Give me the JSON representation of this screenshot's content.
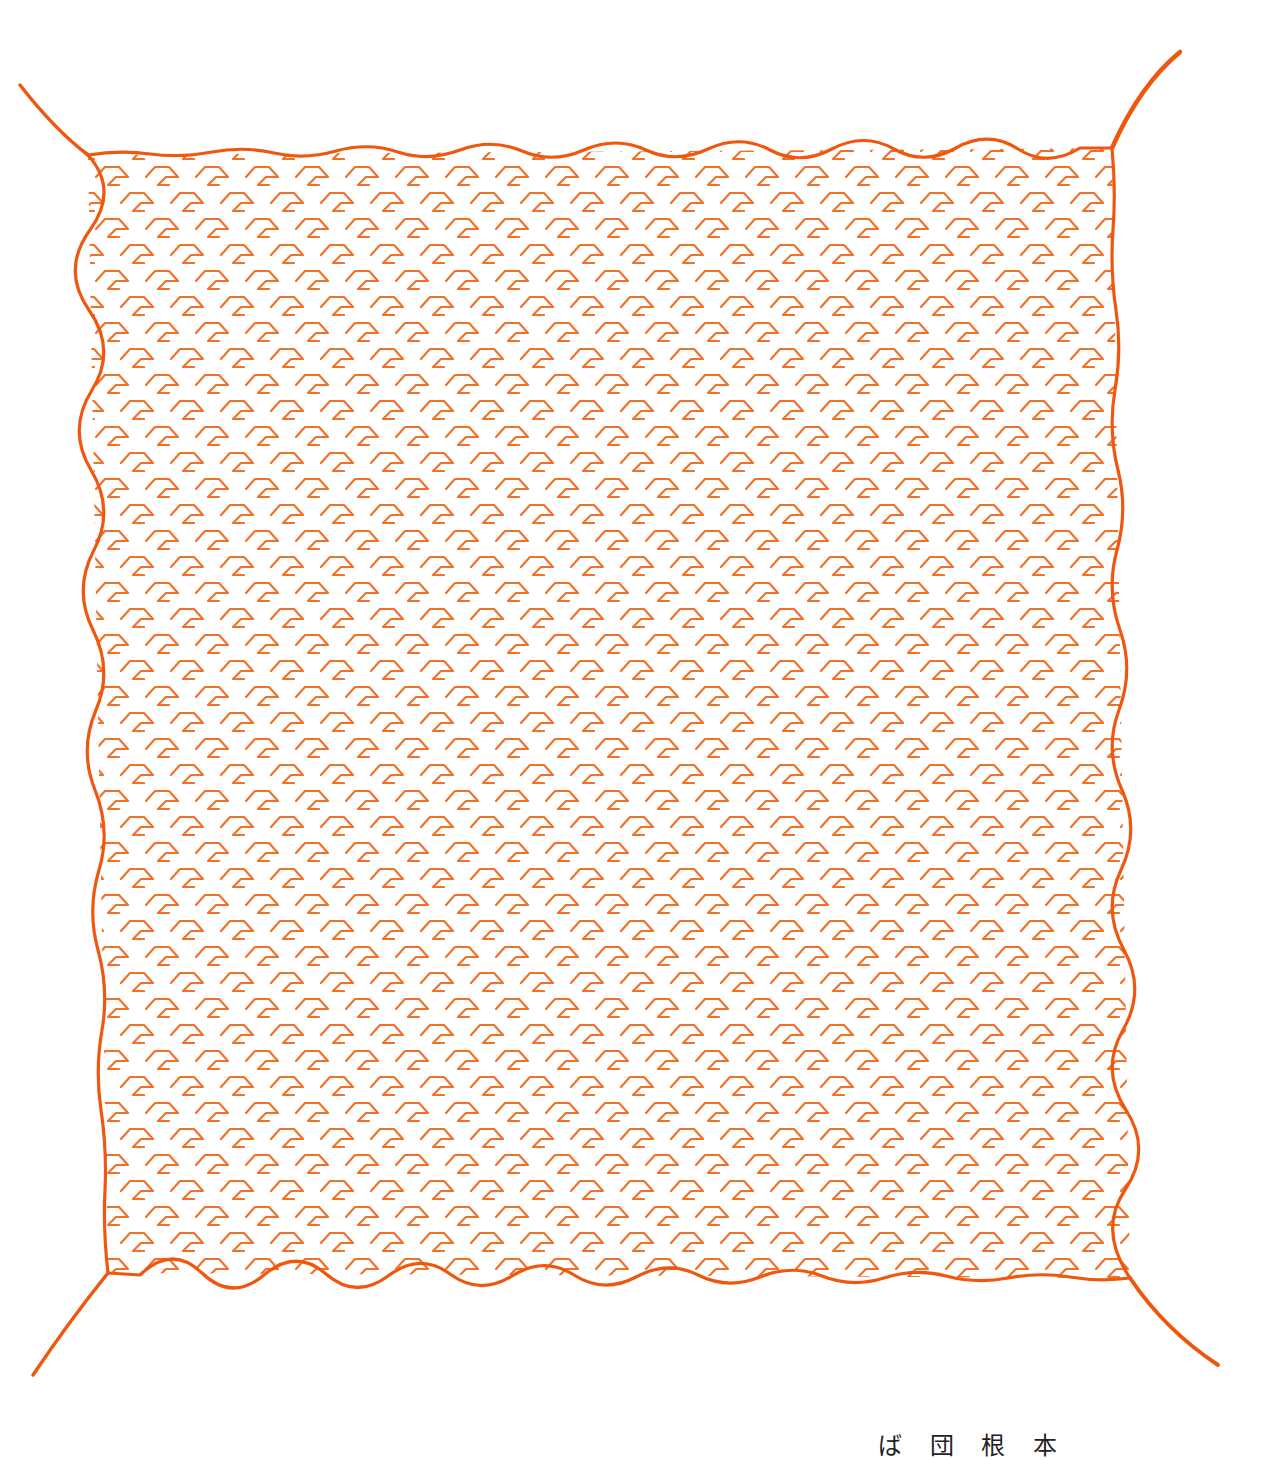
{
  "illustration": {
    "subject": "square cloth / furoshiki with four corner tassels",
    "pattern_motif": "hook-shaped geometric motif repeated in offset rows",
    "colors": {
      "border": "#F0570E",
      "motif": "#F27128",
      "tassel": "#F0570E",
      "background": "#FFFFFF"
    },
    "corners": {
      "top_left": [
        88,
        155
      ],
      "top_right": [
        1112,
        148
      ],
      "bottom_right": [
        1130,
        1278
      ],
      "bottom_left": [
        108,
        1273
      ]
    },
    "tassel_ends": {
      "top_left": [
        20,
        85
      ],
      "top_right": [
        1180,
        52
      ],
      "bottom_right": [
        1218,
        1365
      ],
      "bottom_left": [
        33,
        1375
      ]
    },
    "motif_spacing": {
      "dx": 50,
      "dy": 26
    }
  },
  "caption": {
    "text": "ば 団 根 本"
  }
}
